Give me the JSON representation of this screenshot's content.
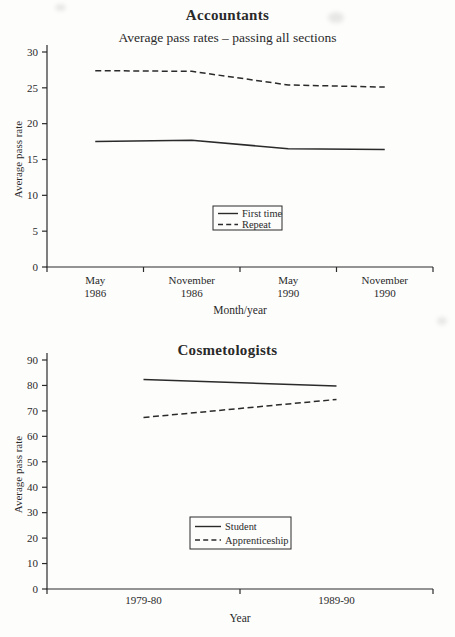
{
  "page": {
    "background": "#fdfdfc",
    "ink": "#2a2a2a"
  },
  "chart_data": [
    {
      "type": "line",
      "title": "Accountants",
      "subtitle": "Average pass rates – passing all sections",
      "ylabel": "Average pass rate",
      "xlabel": "Month/year",
      "categories": [
        [
          "May",
          "1986"
        ],
        [
          "November",
          "1986"
        ],
        [
          "May",
          "1990"
        ],
        [
          "November",
          "1990"
        ]
      ],
      "ylim": [
        0,
        30
      ],
      "yticks": [
        0,
        5,
        10,
        15,
        20,
        25,
        30
      ],
      "grid": false,
      "legend_position": "inside-lower-middle",
      "series": [
        {
          "name": "First time",
          "style": "solid",
          "values": [
            17.5,
            17.7,
            16.5,
            16.4
          ]
        },
        {
          "name": "Repeat",
          "style": "dashed",
          "values": [
            27.4,
            27.3,
            25.4,
            25.1
          ]
        }
      ]
    },
    {
      "type": "line",
      "title": "Cosmetologists",
      "subtitle": "",
      "ylabel": "Average pass rate",
      "xlabel": "Year",
      "categories": [
        [
          "1979-80"
        ],
        [
          "1989-90"
        ]
      ],
      "ylim": [
        0,
        90
      ],
      "yticks": [
        0,
        10,
        20,
        30,
        40,
        50,
        60,
        70,
        80,
        90
      ],
      "grid": false,
      "legend_position": "inside-lower-middle",
      "series": [
        {
          "name": "Student",
          "style": "solid",
          "values": [
            82.3,
            79.8
          ]
        },
        {
          "name": "Apprenticeship",
          "style": "dashed",
          "values": [
            67.4,
            74.5
          ]
        }
      ]
    }
  ]
}
